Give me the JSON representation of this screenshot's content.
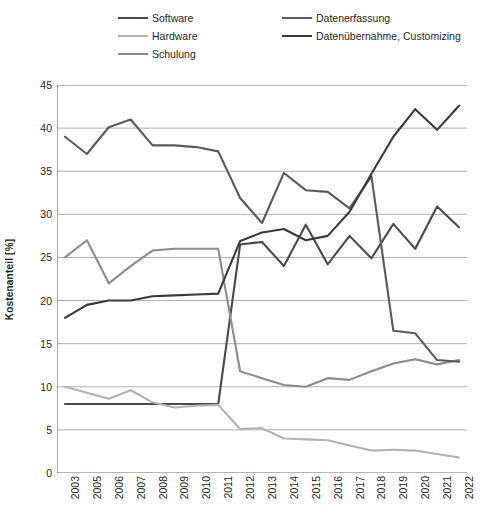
{
  "legend": {
    "items": [
      {
        "label": "Software",
        "color": "#4a4a4a",
        "col": 0,
        "row": 0
      },
      {
        "label": "Hardware",
        "color": "#b3b3b3",
        "col": 0,
        "row": 1
      },
      {
        "label": "Schulung",
        "color": "#8c8c8c",
        "col": 0,
        "row": 2
      },
      {
        "label": "Datenerfassung",
        "color": "#5a5a5a",
        "col": 1,
        "row": 0
      },
      {
        "label": "Datenübernahme, Customizing",
        "color": "#3a3a3a",
        "col": 1,
        "row": 1
      }
    ]
  },
  "chart_data": {
    "type": "line",
    "title": "",
    "xlabel": "",
    "ylabel": "Kostenanteil [%]",
    "ylim": [
      0,
      45
    ],
    "ytick_step": 5,
    "yticks": [
      0,
      5,
      10,
      15,
      20,
      25,
      30,
      35,
      40,
      45
    ],
    "grid": true,
    "legend_position": "top",
    "categories": [
      "2003",
      "2005",
      "2006",
      "2007",
      "2008",
      "2009",
      "2010",
      "2011",
      "2012",
      "2013",
      "2014",
      "2015",
      "2016",
      "2017",
      "2018",
      "2019",
      "2020",
      "2021",
      "2022"
    ],
    "series": [
      {
        "name": "Software",
        "color": "#4a4a4a",
        "values": [
          8.0,
          8.0,
          8.0,
          8.0,
          8.0,
          8.0,
          8.0,
          8.0,
          26.5,
          26.8,
          24.0,
          28.8,
          24.2,
          27.5,
          24.9,
          28.9,
          26.0,
          30.9,
          28.5
        ]
      },
      {
        "name": "Hardware",
        "color": "#b3b3b3",
        "values": [
          10.0,
          9.3,
          8.6,
          9.6,
          8.2,
          7.6,
          7.8,
          7.9,
          5.1,
          5.2,
          4.0,
          3.9,
          3.8,
          3.2,
          2.6,
          2.7,
          2.6,
          2.2,
          1.8
        ]
      },
      {
        "name": "Schulung",
        "color": "#8c8c8c",
        "values": [
          25.0,
          27.0,
          22.0,
          24.0,
          25.8,
          26.0,
          26.0,
          26.0,
          11.8,
          11.0,
          10.2,
          10.0,
          11.0,
          10.8,
          11.8,
          12.7,
          13.2,
          12.6,
          13.1
        ]
      },
      {
        "name": "Datenerfassung",
        "color": "#5a5a5a",
        "values": [
          39.0,
          37.0,
          40.1,
          41.0,
          38.0,
          38.0,
          37.8,
          37.3,
          31.9,
          29.0,
          34.8,
          32.8,
          32.6,
          30.7,
          34.4,
          16.5,
          16.2,
          13.1,
          12.9
        ]
      },
      {
        "name": "Datenübernahme, Customizing",
        "color": "#3a3a3a",
        "values": [
          18.0,
          19.5,
          20.0,
          20.0,
          20.5,
          20.6,
          20.7,
          20.8,
          26.9,
          27.9,
          28.3,
          27.0,
          27.5,
          30.3,
          34.7,
          39.0,
          42.2,
          39.8,
          42.6
        ]
      }
    ]
  }
}
